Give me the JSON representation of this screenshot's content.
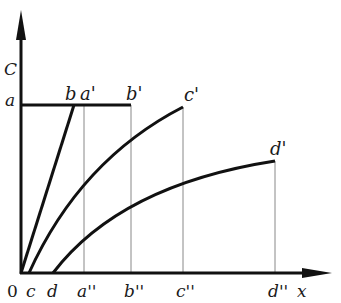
{
  "diagram": {
    "axes": {
      "y_label": "C",
      "x_label": "x",
      "origin_label": "0"
    },
    "points": {
      "a": "a",
      "b": "b",
      "a_prime": "a'",
      "b_prime": "b'",
      "c_prime": "c'",
      "d_prime": "d'",
      "c": "c",
      "d": "d",
      "a_double": "a''",
      "b_double": "b''",
      "c_double": "c''",
      "d_double": "d''"
    },
    "colors": {
      "stroke": "#111111",
      "guide": "#888888"
    }
  }
}
